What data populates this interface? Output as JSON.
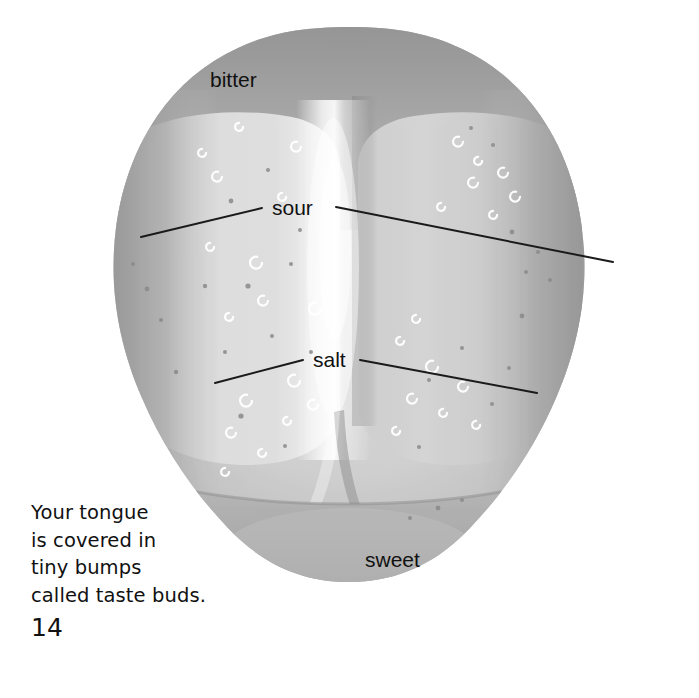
{
  "page": {
    "number": "14",
    "background_color": "#ffffff",
    "text_color": "#111111"
  },
  "caption": {
    "text": "Your tongue\nis covered in\ntiny bumps\ncalled taste buds."
  },
  "figure": {
    "name": "tongue-taste-map",
    "labels": [
      {
        "id": "bitter",
        "text": "bitter",
        "x": 210,
        "y": 69,
        "has_leader_lines": false
      },
      {
        "id": "sour",
        "text": "sour",
        "x": 272,
        "y": 197,
        "has_leader_lines": true
      },
      {
        "id": "salt",
        "text": "salt",
        "x": 313,
        "y": 349,
        "has_leader_lines": true
      },
      {
        "id": "sweet",
        "text": "sweet",
        "x": 365,
        "y": 549,
        "has_leader_lines": false
      }
    ],
    "leader_lines": [
      {
        "id": "sour-left",
        "x1": 141,
        "y1": 237,
        "x2": 262,
        "y2": 208
      },
      {
        "id": "sour-right",
        "x1": 336,
        "y1": 207,
        "x2": 613,
        "y2": 262
      },
      {
        "id": "salt-left",
        "x1": 215,
        "y1": 383,
        "x2": 303,
        "y2": 360
      },
      {
        "id": "salt-right",
        "x1": 360,
        "y1": 360,
        "x2": 537,
        "y2": 393
      }
    ],
    "colors": {
      "tongue_base": "#b6b6b6",
      "tongue_light": "#d9d9d9",
      "tongue_highlight": "#f2f2f2",
      "tongue_dark": "#9a9a9a",
      "tongue_edge": "#8e8e8e",
      "line_color": "#1a1a1a"
    }
  }
}
